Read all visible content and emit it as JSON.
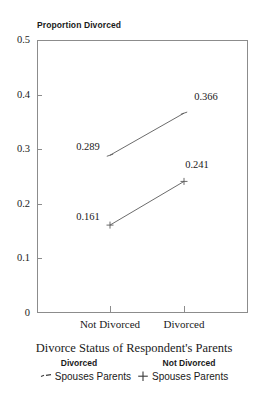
{
  "chart_data": {
    "type": "line",
    "title": "Divorce Status of Respondent's Parents",
    "xlabel": "Divorce Status of Respondent's Parents",
    "ylabel": "Proportion Divorced",
    "categories": [
      "Not Divorced",
      "Divorced"
    ],
    "ylim": [
      0,
      0.5
    ],
    "yticks": [
      "0",
      "0.1",
      "0.2",
      "0.3",
      "0.4",
      "0.5"
    ],
    "ytick_values": [
      0,
      0.1,
      0.2,
      0.3,
      0.4,
      0.5
    ],
    "grid": false,
    "legend_position": "bottom",
    "series": [
      {
        "name": "Divorced Spouses Parents",
        "legend_head": "Divorced",
        "legend_text": "Spouses Parents",
        "marker": "dash-marker",
        "values": [
          0.289,
          0.366
        ],
        "labels": [
          "0.289",
          "0.366"
        ]
      },
      {
        "name": "Not Divorced Spouses Parents",
        "legend_head": "Not Divorced",
        "legend_text": "Spouses Parents",
        "marker": "plus-marker",
        "values": [
          0.161,
          0.241
        ],
        "labels": [
          "0.161",
          "0.241"
        ]
      }
    ],
    "colors": {
      "axis": "#8c8c8c",
      "line": "#5a5a5a",
      "text": "#1a1a1a"
    }
  }
}
